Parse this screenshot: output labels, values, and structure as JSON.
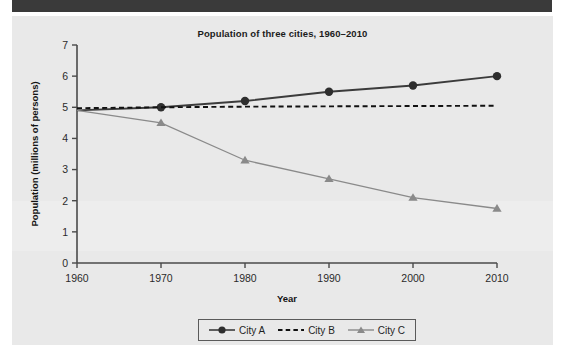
{
  "page": {
    "background_color": "#ffffff",
    "header_bar_color": "#3a3a3a",
    "panel_color": "#e9e9e9"
  },
  "chart_data": {
    "type": "line",
    "title": "Population of three cities, 1960–2010",
    "xlabel": "Year",
    "ylabel": "Population (millions of persons)",
    "x": [
      1960,
      1970,
      1980,
      1990,
      2000,
      2010
    ],
    "xtick_labels": [
      "1960",
      "1970",
      "1980",
      "1990",
      "2000",
      "2010"
    ],
    "ytick_labels": [
      "0",
      "1",
      "2",
      "3",
      "4",
      "5",
      "6",
      "7"
    ],
    "ytick_values": [
      0,
      1,
      2,
      3,
      4,
      5,
      6,
      7
    ],
    "xlim": [
      1960,
      2010
    ],
    "ylim": [
      0,
      7
    ],
    "grid": false,
    "legend_position": "bottom-center",
    "series": [
      {
        "name": "City A",
        "values": [
          4.9,
          5.0,
          5.2,
          5.5,
          5.7,
          6.0
        ],
        "color": "#3b3b3b",
        "line_style": "solid",
        "marker": "circle",
        "marker_at_first_point": false
      },
      {
        "name": "City B",
        "values": [
          4.97,
          5.0,
          5.02,
          5.03,
          5.04,
          5.05
        ],
        "color": "#111111",
        "line_style": "dashed",
        "marker": "none",
        "marker_at_first_point": false
      },
      {
        "name": "City C",
        "values": [
          4.9,
          4.5,
          3.3,
          2.7,
          2.1,
          1.75
        ],
        "color": "#8a8a8a",
        "line_style": "solid",
        "marker": "triangle",
        "marker_at_first_point": false
      }
    ]
  },
  "legend": {
    "entries": [
      {
        "label": "City A",
        "marker": "circle-marker",
        "style": "solid"
      },
      {
        "label": "City B",
        "marker": "no-marker",
        "style": "dashed"
      },
      {
        "label": "City C",
        "marker": "triangle-marker",
        "style": "solid"
      }
    ]
  }
}
